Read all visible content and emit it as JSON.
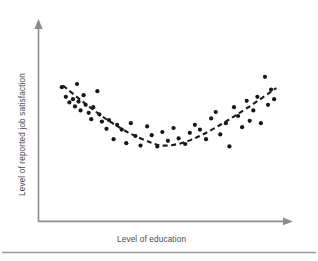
{
  "figure": {
    "name": "scatter-plot-job-satisfaction-vs-education",
    "background_color": "#ffffff"
  },
  "axes": {
    "x_axis": {
      "label": "Level of education",
      "color": "#8d8d8d",
      "arrow": "arrow-right"
    },
    "y_axis": {
      "label": "Level of reported job satisfaction",
      "color": "#8d8d8d",
      "arrow": "arrow-up"
    }
  },
  "footer": {
    "divider_color": "#9a9a9a"
  },
  "chart_data": {
    "type": "scatter",
    "title": "",
    "xlabel": "Level of education",
    "ylabel": "Level of reported job satisfaction",
    "xlim": [
      0,
      100
    ],
    "ylim": [
      0,
      100
    ],
    "grid": false,
    "legend": "none",
    "axis_ticks": "none",
    "point_color": "#161616",
    "point_radius": 2.1,
    "annotation": "U-shaped curvilinear relationship: job satisfaction is high at low education, dips at moderate education, and rises again at high education.",
    "points": [
      {
        "x": 7.0,
        "y": 78.0
      },
      {
        "x": 8.6,
        "y": 72.0
      },
      {
        "x": 10.0,
        "y": 68.5
      },
      {
        "x": 11.4,
        "y": 70.5
      },
      {
        "x": 12.2,
        "y": 66.0
      },
      {
        "x": 13.0,
        "y": 80.0
      },
      {
        "x": 13.6,
        "y": 69.0
      },
      {
        "x": 14.4,
        "y": 63.5
      },
      {
        "x": 15.6,
        "y": 73.0
      },
      {
        "x": 16.4,
        "y": 67.0
      },
      {
        "x": 17.6,
        "y": 62.0
      },
      {
        "x": 18.6,
        "y": 58.0
      },
      {
        "x": 19.4,
        "y": 65.5
      },
      {
        "x": 21.0,
        "y": 75.5
      },
      {
        "x": 21.8,
        "y": 61.0
      },
      {
        "x": 22.8,
        "y": 56.5
      },
      {
        "x": 24.6,
        "y": 52.0
      },
      {
        "x": 25.6,
        "y": 57.5
      },
      {
        "x": 27.4,
        "y": 45.5
      },
      {
        "x": 28.8,
        "y": 54.5
      },
      {
        "x": 30.6,
        "y": 51.5
      },
      {
        "x": 32.4,
        "y": 43.0
      },
      {
        "x": 34.2,
        "y": 55.5
      },
      {
        "x": 36.0,
        "y": 47.5
      },
      {
        "x": 38.0,
        "y": 41.5
      },
      {
        "x": 40.6,
        "y": 53.5
      },
      {
        "x": 42.4,
        "y": 48.0
      },
      {
        "x": 44.6,
        "y": 41.0
      },
      {
        "x": 46.6,
        "y": 50.0
      },
      {
        "x": 48.8,
        "y": 44.5
      },
      {
        "x": 51.0,
        "y": 52.5
      },
      {
        "x": 53.0,
        "y": 46.0
      },
      {
        "x": 55.6,
        "y": 42.5
      },
      {
        "x": 57.4,
        "y": 49.5
      },
      {
        "x": 59.4,
        "y": 54.5
      },
      {
        "x": 61.4,
        "y": 51.5
      },
      {
        "x": 63.8,
        "y": 45.5
      },
      {
        "x": 65.8,
        "y": 58.5
      },
      {
        "x": 67.6,
        "y": 62.5
      },
      {
        "x": 69.4,
        "y": 48.5
      },
      {
        "x": 71.6,
        "y": 55.5
      },
      {
        "x": 73.0,
        "y": 41.0
      },
      {
        "x": 74.8,
        "y": 65.5
      },
      {
        "x": 76.4,
        "y": 60.0
      },
      {
        "x": 78.0,
        "y": 53.0
      },
      {
        "x": 79.8,
        "y": 69.5
      },
      {
        "x": 81.0,
        "y": 57.0
      },
      {
        "x": 82.4,
        "y": 63.5
      },
      {
        "x": 84.0,
        "y": 72.0
      },
      {
        "x": 85.4,
        "y": 55.5
      },
      {
        "x": 87.0,
        "y": 84.5
      },
      {
        "x": 88.2,
        "y": 67.0
      },
      {
        "x": 89.4,
        "y": 76.5
      },
      {
        "x": 90.6,
        "y": 70.5
      }
    ],
    "trend": {
      "name": "quadratic-fit",
      "style": "dashed",
      "color": "#1b1b1b",
      "x_start": 7.5,
      "x_end": 91.5,
      "vertex_x": 47.0,
      "vertex_y": 41.5,
      "curve_points": [
        {
          "x": 7.5,
          "y": 79.0
        },
        {
          "x": 16.0,
          "y": 68.0
        },
        {
          "x": 25.0,
          "y": 57.5
        },
        {
          "x": 34.0,
          "y": 49.0
        },
        {
          "x": 42.0,
          "y": 43.5
        },
        {
          "x": 47.0,
          "y": 41.5
        },
        {
          "x": 54.0,
          "y": 43.0
        },
        {
          "x": 62.0,
          "y": 48.0
        },
        {
          "x": 71.0,
          "y": 56.0
        },
        {
          "x": 80.0,
          "y": 65.0
        },
        {
          "x": 91.5,
          "y": 77.5
        }
      ]
    }
  }
}
